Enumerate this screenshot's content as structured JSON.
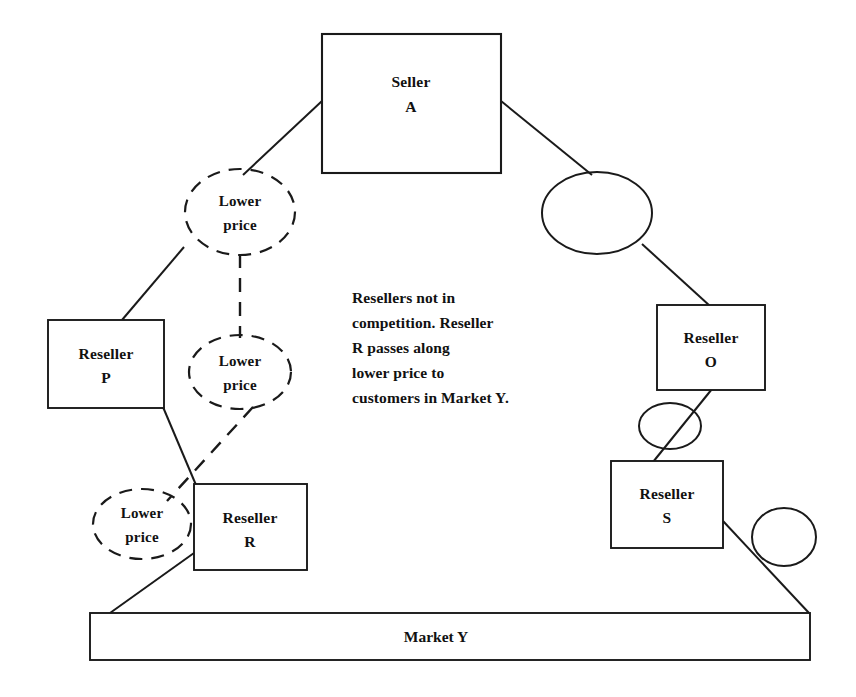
{
  "diagram": {
    "background_color": "#ffffff",
    "line_color": "#1a1a1a",
    "nodes": {
      "seller_a": {
        "line1": "Seller",
        "line2": "A"
      },
      "reseller_p": {
        "line1": "Reseller",
        "line2": "P"
      },
      "reseller_r": {
        "line1": "Reseller",
        "line2": "R"
      },
      "reseller_o": {
        "line1": "Reseller",
        "line2": "O"
      },
      "reseller_s": {
        "line1": "Reseller",
        "line2": "S"
      },
      "market_y": {
        "label": "Market Y"
      },
      "lower_price_top": {
        "line1": "Lower",
        "line2": "price"
      },
      "lower_price_middle": {
        "line1": "Lower",
        "line2": "price"
      },
      "lower_price_bottom": {
        "line1": "Lower",
        "line2": "price"
      },
      "blank_ellipse_top_right": {
        "label": ""
      },
      "blank_ellipse_o_s": {
        "label": ""
      },
      "blank_ellipse_s_right": {
        "label": ""
      }
    },
    "note": {
      "lines": [
        "Resellers not in",
        "competition.  Reseller",
        "R passes along",
        "lower price to",
        "customers in Market Y."
      ]
    }
  }
}
